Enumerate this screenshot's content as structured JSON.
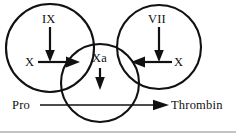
{
  "figure": {
    "background_color": "#ffffff",
    "ink_color": "#111111",
    "rule_color": "#8a8a8a",
    "width": 236,
    "height": 138
  },
  "labels": {
    "ix": "IX",
    "vii": "VII",
    "x_left": "X",
    "x_right": "X",
    "xa": "Xa",
    "pro": "Pro",
    "thrombin": "Thrombin"
  },
  "circles": [
    {
      "name": "left-circle",
      "cx": 50,
      "cy": 48,
      "r": 44
    },
    {
      "name": "center-circle",
      "cx": 100,
      "cy": 83,
      "r": 39
    },
    {
      "name": "right-circle",
      "cx": 159,
      "cy": 47,
      "r": 42
    }
  ],
  "arrows": [
    {
      "name": "ix-to-x-arrow",
      "direction": "down",
      "from_label": "IX",
      "to_label": "X"
    },
    {
      "name": "x-to-xa-arrow",
      "direction": "right",
      "from_label": "X",
      "to_label": "Xa"
    },
    {
      "name": "vii-to-x-arrow",
      "direction": "down",
      "from_label": "VII",
      "to_label": "X"
    },
    {
      "name": "x-to-xa-arrow-right",
      "direction": "left",
      "from_label": "X",
      "to_label": "Xa"
    },
    {
      "name": "xa-down-arrow",
      "direction": "down",
      "from_label": "Xa",
      "to_label": "Pro-Thrombin"
    },
    {
      "name": "pro-to-thrombin-arrow",
      "direction": "right",
      "from_label": "Pro",
      "to_label": "Thrombin"
    }
  ],
  "baseline_rule": {
    "name": "bottom-rule",
    "y": 132
  }
}
